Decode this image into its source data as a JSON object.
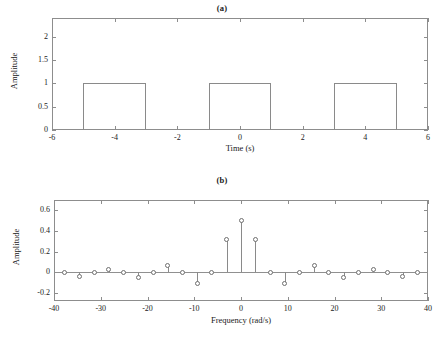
{
  "figure": {
    "background": "#ffffff",
    "line_color": "#8a8a8a",
    "text_color": "#1a1a1a"
  },
  "panel_a": {
    "title": "(a)",
    "xlabel": "Time (s)",
    "ylabel": "Amplitude",
    "xticks": [
      "-6",
      "-4",
      "-2",
      "0",
      "2",
      "4",
      "6"
    ],
    "yticks": [
      "0",
      "0.5",
      "1",
      "1.5",
      "2"
    ]
  },
  "panel_b": {
    "title": "(b)",
    "xlabel": "Frequency (rad/s)",
    "ylabel": "Amplitude",
    "xticks": [
      "-40",
      "-30",
      "-20",
      "-10",
      "0",
      "10",
      "20",
      "30",
      "40"
    ],
    "yticks": [
      "-0.2",
      "0",
      "0.2",
      "0.4",
      "0.6"
    ]
  },
  "chart_data": [
    {
      "type": "line",
      "title": "(a)",
      "xlabel": "Time (s)",
      "ylabel": "Amplitude",
      "xlim": [
        -6,
        6
      ],
      "ylim": [
        0,
        2.4
      ],
      "xticks": [
        -6,
        -4,
        -2,
        0,
        2,
        4,
        6
      ],
      "yticks": [
        0,
        0.5,
        1,
        1.5,
        2
      ],
      "grid": false,
      "legend": null,
      "description": "Periodic rectangular pulse train, period 4 s, pulse width 2 s, amplitude 1",
      "pulses": [
        {
          "start": -5,
          "end": -3,
          "height": 1
        },
        {
          "start": -1,
          "end": 1,
          "height": 1
        },
        {
          "start": 3,
          "end": 5,
          "height": 1
        }
      ],
      "x": [
        -6,
        -5,
        -5,
        -3,
        -3,
        -1,
        -1,
        1,
        1,
        3,
        3,
        5,
        5,
        6
      ],
      "y": [
        0,
        0,
        1,
        1,
        0,
        0,
        1,
        1,
        0,
        0,
        1,
        1,
        0,
        0
      ]
    },
    {
      "type": "scatter",
      "title": "(b)",
      "xlabel": "Frequency (rad/s)",
      "ylabel": "Amplitude",
      "xlim": [
        -40,
        40
      ],
      "ylim": [
        -0.28,
        0.7
      ],
      "xticks": [
        -40,
        -30,
        -20,
        -10,
        0,
        10,
        20,
        30,
        40
      ],
      "yticks": [
        -0.2,
        0,
        0.2,
        0.4,
        0.6
      ],
      "grid": false,
      "legend": null,
      "description": "Fourier series coefficients (stem plot) of the rectangular pulse train; sinc envelope with spacing pi/2 rad/s scaled, harmonics at multiples of about 3.14 rad/s",
      "x": [
        -37.7,
        -34.6,
        -31.4,
        -28.3,
        -25.1,
        -22.0,
        -18.8,
        -15.7,
        -12.6,
        -9.4,
        -6.3,
        -3.1,
        0.0,
        3.1,
        6.3,
        9.4,
        12.6,
        15.7,
        18.8,
        22.0,
        25.1,
        28.3,
        31.4,
        34.6,
        37.7
      ],
      "y": [
        0.0,
        -0.042,
        0.0,
        0.029,
        0.0,
        -0.053,
        0.0,
        0.064,
        0.0,
        -0.106,
        0.0,
        0.318,
        0.5,
        0.318,
        0.0,
        -0.106,
        0.0,
        0.064,
        0.0,
        -0.053,
        0.0,
        0.029,
        0.0,
        -0.042,
        0.0
      ]
    }
  ]
}
